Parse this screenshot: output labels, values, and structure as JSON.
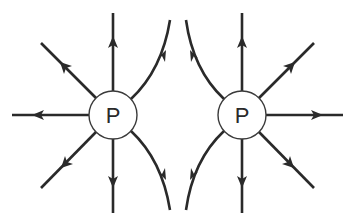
{
  "diagram": {
    "colors": {
      "line": "#2a2a2a",
      "circle_fill": "#ffffff",
      "circle_stroke": "#3a3a3a",
      "background": "#ffffff"
    },
    "charges": [
      {
        "id": "left",
        "label": "P",
        "cx": 113,
        "cy": 115,
        "r": 24
      },
      {
        "id": "right",
        "label": "P",
        "cx": 242,
        "cy": 115,
        "r": 24
      }
    ],
    "field_lines": {
      "left": [
        {
          "direction": "up",
          "type": "straight"
        },
        {
          "direction": "up-left",
          "type": "straight"
        },
        {
          "direction": "left",
          "type": "straight"
        },
        {
          "direction": "down-left",
          "type": "straight"
        },
        {
          "direction": "down",
          "type": "straight"
        },
        {
          "direction": "up-right",
          "type": "curved"
        },
        {
          "direction": "down-right",
          "type": "curved"
        }
      ],
      "right": [
        {
          "direction": "up",
          "type": "straight"
        },
        {
          "direction": "up-right",
          "type": "straight"
        },
        {
          "direction": "right",
          "type": "straight"
        },
        {
          "direction": "down-right",
          "type": "straight"
        },
        {
          "direction": "down",
          "type": "straight"
        },
        {
          "direction": "up-left",
          "type": "curved"
        },
        {
          "direction": "down-left",
          "type": "curved"
        }
      ],
      "arrow_orientation": "outward"
    }
  }
}
